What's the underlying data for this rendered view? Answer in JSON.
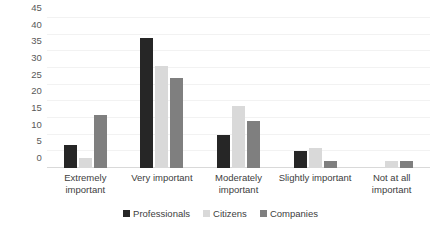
{
  "chart_data": {
    "type": "bar",
    "title": "",
    "subtitle": "",
    "xlabel": "",
    "ylabel": "",
    "ylim": [
      0,
      45
    ],
    "yticks": [
      0,
      5,
      10,
      15,
      20,
      25,
      30,
      35,
      40,
      45
    ],
    "grid": true,
    "legend_position": "bottom",
    "categories": [
      "Extremely important",
      "Very important",
      "Moderately important",
      "Slightly important",
      "Not at all important"
    ],
    "series": [
      {
        "name": "Professionals",
        "color": "#262626",
        "values": [
          7,
          39,
          10,
          5,
          0
        ]
      },
      {
        "name": "Citizens",
        "color": "#D9D9D9",
        "values": [
          3,
          30.5,
          18.5,
          6,
          2
        ]
      },
      {
        "name": "Companies",
        "color": "#7F7F7F",
        "values": [
          16,
          27,
          14,
          2,
          2
        ]
      }
    ]
  },
  "axis": {
    "y_tick_labels": [
      "0",
      "5",
      "10",
      "15",
      "20",
      "25",
      "30",
      "35",
      "40",
      "45"
    ]
  },
  "legend": {
    "items": [
      {
        "label": "Professionals"
      },
      {
        "label": "Citizens"
      },
      {
        "label": "Companies"
      }
    ]
  }
}
